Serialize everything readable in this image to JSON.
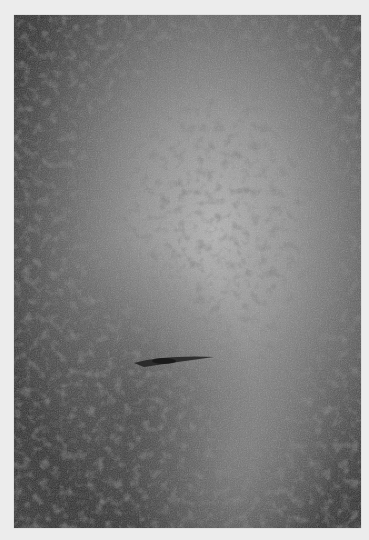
{
  "image": {
    "subject": "grayscale close-up of skin texture with dense dark spots",
    "colors": {
      "background": "#ececec",
      "dark_edge": "#2e2e2e",
      "mid_tone": "#5a5a5a",
      "highlight": "#b4b4b4",
      "spot": "#3c3c3c"
    }
  }
}
